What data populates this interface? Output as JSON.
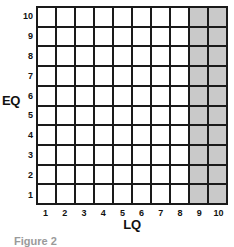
{
  "chart_data": {
    "type": "heatmap",
    "title": "",
    "xlabel": "LQ",
    "ylabel": "EQ",
    "x_tick_labels": [
      "1",
      "2",
      "3",
      "4",
      "5",
      "6",
      "7",
      "8",
      "9",
      "10"
    ],
    "y_tick_labels": [
      "10",
      "9",
      "8",
      "7",
      "6",
      "5",
      "4",
      "3",
      "2",
      "1"
    ],
    "xlim": [
      1,
      10
    ],
    "ylim": [
      1,
      10
    ],
    "grid": true,
    "legend": "none",
    "rows": 10,
    "columns": 10,
    "cell_values": [
      [
        0,
        0,
        0,
        0,
        0,
        0,
        0,
        0,
        1,
        1
      ],
      [
        0,
        0,
        0,
        0,
        0,
        0,
        0,
        0,
        1,
        1
      ],
      [
        0,
        0,
        0,
        0,
        0,
        0,
        0,
        0,
        1,
        1
      ],
      [
        0,
        0,
        0,
        0,
        0,
        0,
        0,
        0,
        1,
        1
      ],
      [
        0,
        0,
        0,
        0,
        0,
        0,
        0,
        0,
        1,
        1
      ],
      [
        0,
        0,
        0,
        0,
        0,
        0,
        0,
        0,
        1,
        1
      ],
      [
        0,
        0,
        0,
        0,
        0,
        0,
        0,
        0,
        1,
        1
      ],
      [
        0,
        0,
        0,
        0,
        0,
        0,
        0,
        0,
        1,
        1
      ],
      [
        0,
        0,
        0,
        0,
        0,
        0,
        0,
        0,
        1,
        1
      ],
      [
        0,
        0,
        0,
        0,
        0,
        0,
        0,
        0,
        1,
        1
      ]
    ],
    "shaded_columns": [
      9,
      10
    ],
    "annotations": []
  },
  "colors": {
    "shaded_cell": "#c9c9c9",
    "empty_cell": "#ffffff",
    "gridline": "#1a1a1a",
    "label_text": "#111111",
    "caption_text": "#9a9a9a",
    "background": "#ffffff"
  },
  "caption": {
    "text": "Figure 2"
  }
}
